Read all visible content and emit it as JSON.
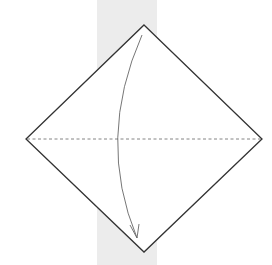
{
  "diagram": {
    "type": "origami-fold-step",
    "colors": {
      "background": "#ffffff",
      "band": "#ececec",
      "paper_fill": "#ffffff",
      "outline": "#333333",
      "fold_line": "#777777",
      "arrow": "#666666"
    },
    "elements": [
      {
        "name": "paper-square",
        "kind": "diamond"
      },
      {
        "name": "valley-fold-line",
        "kind": "dashed-line",
        "orientation": "horizontal-diagonal"
      },
      {
        "name": "fold-arrow",
        "kind": "curved-arrow",
        "direction": "top-corner-to-bottom-corner"
      }
    ]
  }
}
